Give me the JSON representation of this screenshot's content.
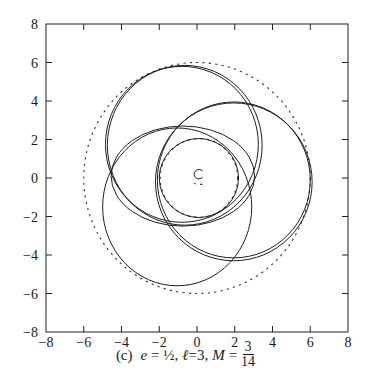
{
  "chart_data": {
    "type": "line",
    "title": "",
    "caption": {
      "panel": "(c)",
      "e_label": "e",
      "e_value": "½",
      "l_label": "ℓ",
      "l_value": "3",
      "M_label": "M",
      "M_num": "3",
      "M_den": "14"
    },
    "xlabel": "",
    "ylabel": "",
    "xlim": [
      -8,
      8
    ],
    "ylim": [
      -8,
      8
    ],
    "x_ticks": [
      -8,
      -6,
      -4,
      -2,
      0,
      2,
      4,
      6,
      8
    ],
    "y_ticks": [
      -8,
      -6,
      -4,
      -2,
      0,
      2,
      4,
      6,
      8
    ],
    "x_tick_labels": [
      "−8",
      "−6",
      "−4",
      "−2",
      "0",
      "2",
      "4",
      "6",
      "8"
    ],
    "y_tick_labels": [
      "8",
      "6",
      "4",
      "2",
      "0",
      "−2",
      "−4",
      "−6",
      "−8"
    ],
    "grid": false,
    "legend": null,
    "bounds": [
      {
        "name": "outer dashed circle",
        "style": "dashed",
        "center": [
          0,
          0
        ],
        "radius": 6.0
      },
      {
        "name": "inner dashed circle",
        "style": "dashed",
        "center": [
          0.1,
          0.0
        ],
        "radius": 2.05
      },
      {
        "name": "central small arc",
        "style": "solid",
        "center": [
          0.1,
          0.2
        ],
        "radius": 0.25
      }
    ],
    "series": [
      {
        "name": "loop top",
        "style": "solid",
        "shape": "ellipse",
        "center": [
          -0.8,
          1.75
        ],
        "rx": 4.05,
        "ry": 4.05
      },
      {
        "name": "loop top (2nd pass)",
        "style": "solid",
        "shape": "ellipse",
        "center": [
          -0.65,
          1.7
        ],
        "rx": 4.1,
        "ry": 4.15
      },
      {
        "name": "loop right",
        "style": "solid",
        "shape": "ellipse",
        "center": [
          1.95,
          -0.1
        ],
        "rx": 4.05,
        "ry": 4.05
      },
      {
        "name": "loop right (2nd pass)",
        "style": "solid",
        "shape": "ellipse",
        "center": [
          1.95,
          -0.2
        ],
        "rx": 4.15,
        "ry": 4.1
      },
      {
        "name": "loop lower-left",
        "style": "solid",
        "shape": "ellipse",
        "center": [
          -1.05,
          -1.5
        ],
        "rx": 3.95,
        "ry": 4.1
      },
      {
        "name": "loop middle-left",
        "style": "solid",
        "shape": "ellipse",
        "center": [
          -0.75,
          0.1
        ],
        "rx": 3.8,
        "ry": 2.6
      },
      {
        "name": "inner loop",
        "style": "solid",
        "shape": "ellipse",
        "center": [
          0.1,
          0.0
        ],
        "rx": 2.1,
        "ry": 2.05
      }
    ]
  },
  "figure": {
    "plot_px": {
      "left": 46,
      "top": 24,
      "right": 348,
      "bottom": 332
    },
    "colors": {
      "line": "#1e1e1e",
      "frame": "#222222",
      "background": "#ffffff"
    }
  }
}
